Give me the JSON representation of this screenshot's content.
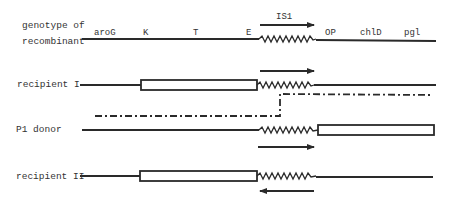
{
  "diagram": {
    "rows": [
      {
        "id": "recombinant",
        "label_line1": "genotype of",
        "label_line2": "recombinant"
      },
      {
        "id": "recipient1",
        "label": "recipient I"
      },
      {
        "id": "p1donor",
        "label": "P1 donor"
      },
      {
        "id": "recipient2",
        "label": "recipient II"
      }
    ],
    "genes": {
      "aroG": "aroG",
      "K": "K",
      "T": "T",
      "E": "E",
      "OP": "OP",
      "chlD": "chlD",
      "pgl": "pgl"
    },
    "insertion_label": "IS1",
    "colors": {
      "line": "#2a2a2a",
      "text": "#333333",
      "background": "#ffffff"
    }
  }
}
